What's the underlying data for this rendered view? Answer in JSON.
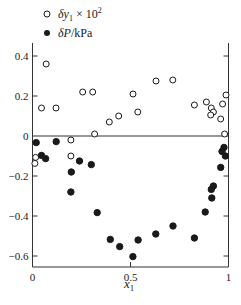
{
  "chart_data": {
    "type": "scatter",
    "title": "",
    "xlabel": "x1",
    "ylabel": "",
    "xlim": [
      0,
      1
    ],
    "ylim": [
      -0.65,
      0.46
    ],
    "x_ticks": [
      0,
      0.5,
      1
    ],
    "x_tick_labels": [
      "0",
      "0.5",
      "1"
    ],
    "y_ticks": [
      0.4,
      0.2,
      0,
      -0.2,
      -0.4,
      -0.6
    ],
    "y_tick_labels": [
      "0.4",
      "0.2",
      "0",
      "−0.2",
      "−0.4",
      "−0.6"
    ],
    "grid": false,
    "zero_line": true,
    "legend_position": "top-left, above plot",
    "series": [
      {
        "name": "δy1 × 10^2",
        "marker": "open-circle",
        "color": "#1a1a1a",
        "points": [
          [
            0.07,
            0.36
          ],
          [
            0.046,
            0.14
          ],
          [
            0.12,
            0.14
          ],
          [
            0.256,
            0.22
          ],
          [
            0.307,
            0.22
          ],
          [
            0.317,
            0.01
          ],
          [
            0.392,
            0.07
          ],
          [
            0.44,
            0.1
          ],
          [
            0.513,
            0.21
          ],
          [
            0.537,
            0.12
          ],
          [
            0.63,
            0.275
          ],
          [
            0.716,
            0.28
          ],
          [
            0.826,
            0.155
          ],
          [
            0.887,
            0.17
          ],
          [
            0.912,
            0.14
          ],
          [
            0.923,
            0.12
          ],
          [
            0.909,
            0.105
          ],
          [
            0.96,
            0.085
          ],
          [
            0.97,
            0.16
          ],
          [
            0.987,
            0.205
          ],
          [
            0.98,
            0.01
          ],
          [
            0.196,
            -0.02
          ],
          [
            0.196,
            -0.1
          ],
          [
            0.016,
            -0.107
          ],
          [
            0.012,
            -0.137
          ]
        ]
      },
      {
        "name": "δP/kPa",
        "marker": "filled-circle",
        "color": "#1a1a1a",
        "points": [
          [
            0.019,
            -0.033
          ],
          [
            0.121,
            -0.028
          ],
          [
            0.046,
            -0.097
          ],
          [
            0.067,
            -0.113
          ],
          [
            0.24,
            -0.125
          ],
          [
            0.3,
            -0.143
          ],
          [
            0.198,
            -0.18
          ],
          [
            0.196,
            -0.28
          ],
          [
            0.33,
            -0.383
          ],
          [
            0.397,
            -0.517
          ],
          [
            0.445,
            -0.553
          ],
          [
            0.512,
            -0.603
          ],
          [
            0.539,
            -0.52
          ],
          [
            0.629,
            -0.49
          ],
          [
            0.717,
            -0.45
          ],
          [
            0.826,
            -0.51
          ],
          [
            0.881,
            -0.38
          ],
          [
            0.915,
            -0.31
          ],
          [
            0.912,
            -0.267
          ],
          [
            0.923,
            -0.25
          ],
          [
            0.96,
            -0.157
          ],
          [
            0.977,
            -0.057
          ],
          [
            0.967,
            -0.077
          ],
          [
            0.984,
            -0.1
          ]
        ]
      }
    ]
  },
  "legend": {
    "open_label_main": "δy",
    "open_label_sub": "1",
    "open_label_rest": " × 10",
    "open_label_sup": "2",
    "filled_label_main": "δP",
    "filled_label_rest": "/kPa"
  },
  "axes": {
    "x_title": "x",
    "x_title_sub": "1"
  }
}
